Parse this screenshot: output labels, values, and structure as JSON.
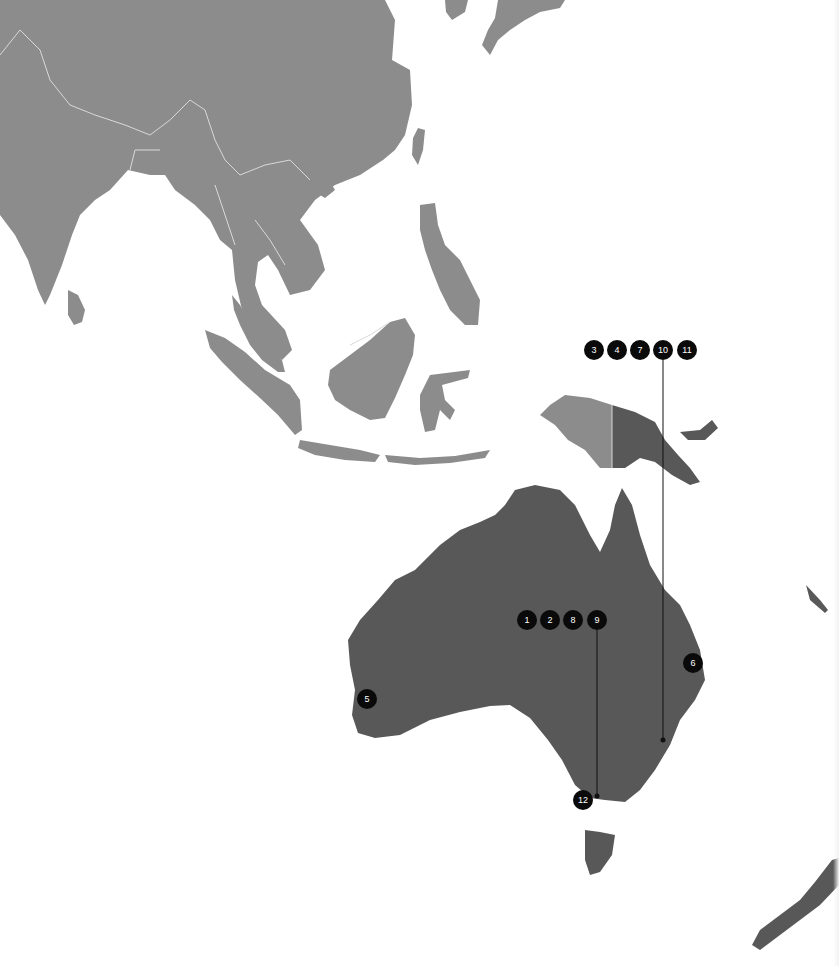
{
  "map": {
    "region": "Asia-Pacific",
    "colors": {
      "background": "#ffffff",
      "context_land": "#8c8c8c",
      "highlighted_land": "#585858",
      "borders": "#d8d8d8",
      "marker_fill": "#0a0a0a",
      "marker_text": "#ffffff",
      "leader_line": "#111111"
    },
    "highlighted_countries": [
      "Australia",
      "Papua New Guinea",
      "New Zealand"
    ],
    "context_countries": [
      "India",
      "Sri Lanka",
      "China",
      "Nepal",
      "Bangladesh",
      "Myanmar",
      "Thailand",
      "Laos",
      "Vietnam",
      "Cambodia",
      "Malaysia",
      "Indonesia",
      "Philippines",
      "Taiwan",
      "Korea",
      "Japan"
    ]
  },
  "marker_groups": [
    {
      "id": "group-png",
      "markers": [
        {
          "label": "3",
          "x": 594,
          "y": 350
        },
        {
          "label": "4",
          "x": 617,
          "y": 350
        },
        {
          "label": "7",
          "x": 640,
          "y": 350
        },
        {
          "label": "10",
          "x": 663,
          "y": 350
        },
        {
          "label": "11",
          "x": 687,
          "y": 350
        }
      ],
      "leader": {
        "from_x": 663,
        "from_y": 360,
        "to_x": 663,
        "to_y": 740
      }
    },
    {
      "id": "group-central-au",
      "markers": [
        {
          "label": "1",
          "x": 527,
          "y": 620
        },
        {
          "label": "2",
          "x": 550,
          "y": 620
        },
        {
          "label": "8",
          "x": 573,
          "y": 620
        },
        {
          "label": "9",
          "x": 597,
          "y": 620
        }
      ],
      "leader": {
        "from_x": 597,
        "from_y": 630,
        "to_x": 597,
        "to_y": 796
      }
    },
    {
      "id": "group-single",
      "markers": [
        {
          "label": "5",
          "x": 367,
          "y": 699
        },
        {
          "label": "6",
          "x": 693,
          "y": 663
        },
        {
          "label": "12",
          "x": 583,
          "y": 800
        }
      ]
    }
  ]
}
